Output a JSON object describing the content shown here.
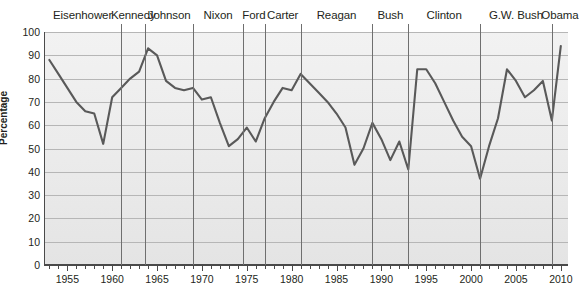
{
  "chart_data": {
    "type": "line",
    "title": "",
    "xlabel": "",
    "ylabel": "Percentage",
    "xlim": [
      1952.4,
      2010.8
    ],
    "ylim": [
      0,
      100
    ],
    "grid": true,
    "legend": "none",
    "y_ticks": [
      0,
      10,
      20,
      30,
      40,
      50,
      60,
      70,
      80,
      90,
      100
    ],
    "x_ticks": [
      1955,
      1960,
      1965,
      1970,
      1975,
      1980,
      1985,
      1990,
      1995,
      2000,
      2005,
      2010
    ],
    "x_tick_minor_step": 1,
    "line_color": "#595959",
    "series": [
      {
        "name": "Percentage",
        "x": [
          1953,
          1954,
          1955,
          1956,
          1957,
          1958,
          1959,
          1960,
          1961,
          1962,
          1963,
          1964,
          1965,
          1966,
          1967,
          1968,
          1969,
          1970,
          1971,
          1972,
          1973,
          1974,
          1975,
          1976,
          1977,
          1978,
          1979,
          1980,
          1981,
          1982,
          1983,
          1984,
          1985,
          1986,
          1987,
          1988,
          1989,
          1990,
          1991,
          1992,
          1993,
          1994,
          1995,
          1996,
          1997,
          1998,
          1999,
          2000,
          2001,
          2002,
          2003,
          2004,
          2005,
          2006,
          2007,
          2008,
          2009,
          2010
        ],
        "values": [
          88,
          82,
          76,
          70,
          66,
          65,
          52,
          72,
          76,
          80,
          83,
          93,
          90,
          79,
          76,
          75,
          76,
          71,
          72,
          61,
          51,
          54,
          59,
          53,
          63,
          70,
          76,
          75,
          82,
          78,
          74,
          70,
          65,
          59,
          43,
          50,
          61,
          54,
          45,
          53,
          41,
          84,
          84,
          78,
          70,
          62,
          55,
          51,
          37,
          51,
          63,
          84,
          79,
          72,
          75,
          79,
          62,
          94
        ]
      }
    ],
    "president_terms": [
      {
        "name": "Eisenhower",
        "start": 1952.4,
        "end": 1961.0
      },
      {
        "name": "Kennedy",
        "start": 1961.0,
        "end": 1963.7
      },
      {
        "name": "Johnson",
        "start": 1963.7,
        "end": 1969.0
      },
      {
        "name": "Nixon",
        "start": 1969.0,
        "end": 1974.6
      },
      {
        "name": "Ford",
        "start": 1974.6,
        "end": 1977.0
      },
      {
        "name": "Carter",
        "start": 1977.0,
        "end": 1981.0
      },
      {
        "name": "Reagan",
        "start": 1981.0,
        "end": 1989.0
      },
      {
        "name": "Bush",
        "start": 1989.0,
        "end": 1993.0
      },
      {
        "name": "Clinton",
        "start": 1993.0,
        "end": 2001.0
      },
      {
        "name": "G.W. Bush",
        "start": 2001.0,
        "end": 2009.0
      },
      {
        "name": "Obama",
        "start": 2009.0,
        "end": 2010.8
      }
    ]
  }
}
